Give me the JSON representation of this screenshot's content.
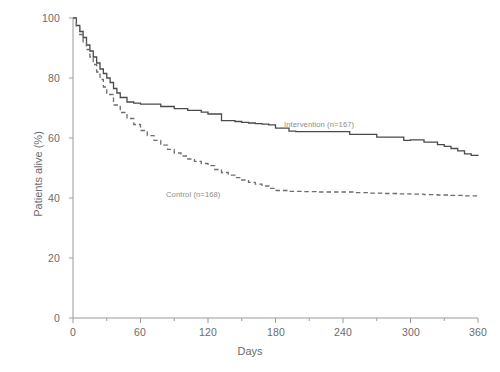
{
  "chart_data": {
    "type": "line",
    "title": "",
    "subtitle": "",
    "xlabel": "Days",
    "ylabel": "Patients alive (%)",
    "xlim": [
      0,
      360
    ],
    "ylim": [
      0,
      100
    ],
    "xticks": [
      "0",
      "60",
      "120",
      "180",
      "240",
      "300",
      "360"
    ],
    "xtick_values": [
      0,
      60,
      120,
      180,
      240,
      300,
      360
    ],
    "xminor_step": 30,
    "yticks": [
      "0",
      "20",
      "40",
      "60",
      "80",
      "100"
    ],
    "ytick_values": [
      0,
      20,
      40,
      60,
      80,
      100
    ],
    "grid": false,
    "legend_position": "inline-annotation",
    "series": [
      {
        "name": "Intervention (n=167)",
        "style": "solid",
        "color": "#4a4a4a",
        "x": [
          0,
          3,
          6,
          9,
          12,
          15,
          18,
          21,
          24,
          27,
          30,
          33,
          36,
          39,
          42,
          48,
          54,
          60,
          66,
          72,
          78,
          84,
          90,
          96,
          102,
          108,
          114,
          120,
          126,
          132,
          138,
          144,
          150,
          156,
          162,
          168,
          174,
          180,
          186,
          192,
          198,
          210,
          222,
          234,
          246,
          258,
          270,
          282,
          294,
          300,
          312,
          324,
          330,
          336,
          342,
          348,
          354,
          360
        ],
        "y": [
          100,
          97.5,
          95.5,
          93.5,
          91,
          89,
          87,
          85,
          83,
          81.5,
          80,
          78.5,
          76.5,
          75,
          73.5,
          72,
          71.6,
          71.3,
          71.3,
          71.3,
          70.5,
          70.5,
          69.8,
          69.8,
          69.2,
          69.2,
          68.6,
          68,
          68,
          65.8,
          65.8,
          65.5,
          65.2,
          65,
          64.8,
          64.6,
          64.4,
          63.3,
          63.3,
          62.3,
          62.1,
          62.1,
          62.1,
          62.1,
          61.2,
          61.2,
          60.3,
          60.3,
          59.2,
          59.4,
          58.6,
          57.8,
          57.2,
          56.5,
          55.7,
          54.7,
          54.2,
          54.0
        ]
      },
      {
        "name": "Control (n=168)",
        "style": "dashed",
        "color": "#6d6d6d",
        "x": [
          0,
          3,
          6,
          9,
          12,
          15,
          18,
          21,
          24,
          27,
          30,
          36,
          42,
          48,
          54,
          60,
          66,
          72,
          78,
          84,
          90,
          96,
          102,
          108,
          114,
          120,
          126,
          132,
          138,
          144,
          150,
          156,
          162,
          168,
          174,
          180,
          192,
          204,
          216,
          228,
          240,
          252,
          264,
          276,
          288,
          300,
          312,
          324,
          336,
          348,
          360
        ],
        "y": [
          100,
          97,
          94.5,
          92,
          89.5,
          87,
          84.5,
          82,
          79.5,
          77,
          74.5,
          71,
          68.5,
          66.5,
          64.5,
          62.5,
          60.8,
          59.2,
          57.6,
          56.2,
          55,
          54,
          53,
          52.2,
          51.5,
          50.8,
          49.5,
          48.5,
          47.6,
          46.8,
          46,
          45.2,
          44.6,
          44,
          43.2,
          42.5,
          42.2,
          42.1,
          42,
          42,
          42,
          41.8,
          41.6,
          41.5,
          41.4,
          41.3,
          41.1,
          41,
          40.9,
          40.7,
          40.5
        ]
      }
    ],
    "annotations": [
      {
        "name": "intervention-label",
        "text": "Intervention (n=167)",
        "x": 215,
        "y": 66
      },
      {
        "name": "control-label",
        "text": "Control (n=168)",
        "x": 80,
        "y": 44
      }
    ]
  },
  "axis": {
    "y_title": "Patients alive (%)",
    "x_title": "Days",
    "yticks": [
      "100",
      "80",
      "60",
      "40",
      "20",
      "0"
    ],
    "xticks": [
      "0",
      "60",
      "120",
      "180",
      "240",
      "300",
      "360"
    ]
  },
  "colors": {
    "intervention": "#4a4a4a",
    "control": "#6d6d6d",
    "axis": "#9a9a9a",
    "text": "#6b6b6b",
    "annotation": "#8d8d8d"
  },
  "caption": ""
}
